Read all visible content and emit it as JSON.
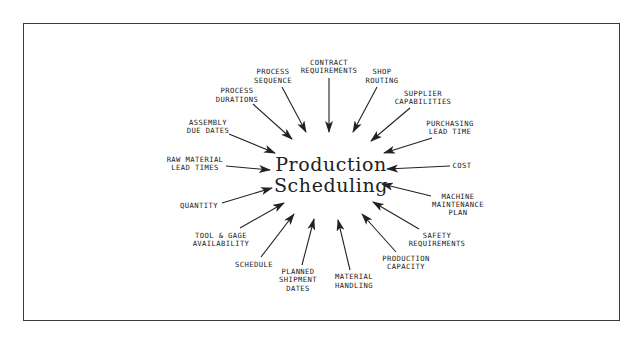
{
  "diagram": {
    "center": {
      "line1": "Production",
      "line2": "Scheduling"
    },
    "inputs": [
      {
        "id": "contract",
        "lines": [
          "CONTRACT",
          "REQUIREMENTS"
        ]
      },
      {
        "id": "shop",
        "lines": [
          "SHOP",
          "ROUTING"
        ]
      },
      {
        "id": "supplier",
        "lines": [
          "SUPPLIER",
          "CAPABILITIES"
        ]
      },
      {
        "id": "purchasing",
        "lines": [
          "PURCHASING",
          "LEAD TIME"
        ]
      },
      {
        "id": "cost",
        "lines": [
          "COST"
        ]
      },
      {
        "id": "machine",
        "lines": [
          "MACHINE",
          "MAINTENANCE",
          "PLAN"
        ]
      },
      {
        "id": "safety",
        "lines": [
          "SAFETY",
          "REQUIREMENTS"
        ]
      },
      {
        "id": "production",
        "lines": [
          "PRODUCTION",
          "CAPACITY"
        ]
      },
      {
        "id": "material",
        "lines": [
          "MATERIAL",
          "HANDLING"
        ]
      },
      {
        "id": "planned",
        "lines": [
          "PLANNED",
          "SHIPMENT",
          "DATES"
        ]
      },
      {
        "id": "schedule",
        "lines": [
          "SCHEDULE"
        ]
      },
      {
        "id": "tool",
        "lines": [
          "TOOL & GAGE",
          "AVAILABILITY"
        ]
      },
      {
        "id": "quantity",
        "lines": [
          "QUANTITY"
        ]
      },
      {
        "id": "rawmat",
        "lines": [
          "RAW MATERIAL",
          "LEAD TIMES"
        ]
      },
      {
        "id": "assembly",
        "lines": [
          "ASSEMBLY",
          "DUE DATES"
        ]
      },
      {
        "id": "durations",
        "lines": [
          "PROCESS",
          "DURATIONS"
        ]
      },
      {
        "id": "sequence",
        "lines": [
          "PROCESS",
          "SEQUENCE"
        ]
      }
    ]
  }
}
